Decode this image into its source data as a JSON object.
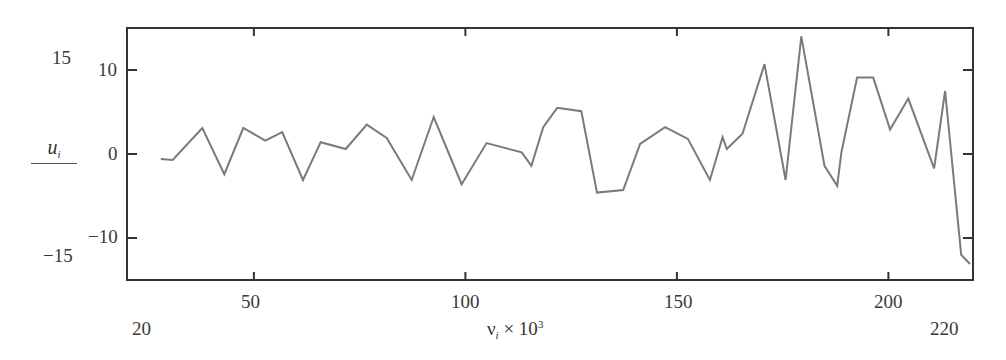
{
  "chart_data": {
    "type": "line",
    "title": "",
    "xlabel": "ν_i × 10^3",
    "ylabel": "u_i",
    "xlim": [
      20,
      220
    ],
    "ylim": [
      -15,
      15
    ],
    "x_ticks": [
      50,
      100,
      150,
      200
    ],
    "y_ticks": [
      -10,
      0,
      10
    ],
    "x_range_labels": {
      "min": "20",
      "max": "220"
    },
    "y_range_labels": {
      "min": "-15",
      "max": "15"
    },
    "grid": false,
    "legend": null,
    "line_color": "#7a7a7a",
    "series": [
      {
        "name": "u_i",
        "x": [
          28.0,
          30.8,
          37.8,
          43.0,
          47.5,
          52.7,
          56.7,
          61.6,
          65.8,
          71.7,
          76.7,
          81.4,
          87.3,
          92.5,
          99.1,
          105.0,
          113.3,
          115.6,
          118.4,
          121.7,
          127.4,
          131.1,
          137.3,
          141.3,
          147.2,
          152.6,
          157.8,
          160.8,
          161.8,
          165.5,
          170.7,
          175.7,
          179.4,
          184.9,
          187.9,
          188.9,
          192.6,
          196.4,
          200.4,
          204.7,
          210.8,
          213.4,
          217.2,
          219.3
        ],
        "y": [
          -0.6,
          -0.7,
          3.1,
          -2.4,
          3.1,
          1.6,
          2.6,
          -3.1,
          1.4,
          0.6,
          3.5,
          1.9,
          -3.1,
          4.4,
          -3.6,
          1.3,
          0.2,
          -1.4,
          3.2,
          5.5,
          5.1,
          -4.6,
          -4.3,
          1.2,
          3.2,
          1.8,
          -3.1,
          2.0,
          0.6,
          2.4,
          10.7,
          -3.1,
          14.0,
          -1.4,
          -3.8,
          0.2,
          9.1,
          9.1,
          2.9,
          6.6,
          -1.7,
          7.5,
          -12.0,
          -13.1
        ]
      }
    ]
  },
  "axis_labels": {
    "y_top_outer": "15",
    "y_bottom_outer": "−15",
    "y_tick_10": "10",
    "y_tick_0": "0",
    "y_tick_m10": "−10",
    "x_left_outer": "20",
    "x_right_outer": "220",
    "x_tick_50": "50",
    "x_tick_100": "100",
    "x_tick_150": "150",
    "x_tick_200": "200",
    "ylabel_name": "u",
    "ylabel_sub": "i",
    "xlabel_name": "ν",
    "xlabel_sub": "i",
    "xlabel_times": " × 10",
    "xlabel_exp": "3"
  }
}
